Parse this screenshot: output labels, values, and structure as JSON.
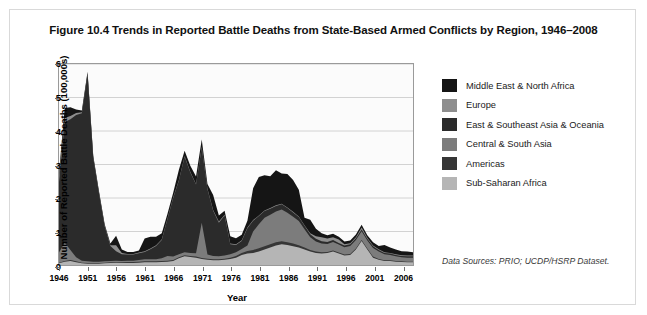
{
  "figure": {
    "title": "Figure 10.4 Trends in Reported Battle Deaths from State-Based Armed Conflicts by Region, 1946–2008",
    "data_sources": "Data Sources: PRIO; UCDP/HSRP Dataset."
  },
  "legend": {
    "items": [
      {
        "label": "Middle East & North Africa",
        "color": "#151515"
      },
      {
        "label": "Europe",
        "color": "#8e8e8e"
      },
      {
        "label": "East & Southeast Asia & Oceania",
        "color": "#2b2b2b"
      },
      {
        "label": "Central & South Asia",
        "color": "#7c7c7c"
      },
      {
        "label": "Americas",
        "color": "#363636"
      },
      {
        "label": "Sub-Saharan Africa",
        "color": "#b5b5b5"
      }
    ]
  },
  "chart_data": {
    "type": "area",
    "stacked": true,
    "title": "Figure 10.4 Trends in Reported Battle Deaths from State-Based Armed Conflicts by Region, 1946–2008",
    "xlabel": "Year",
    "ylabel": "Number of Reported Battle Deaths (100,000s)",
    "xlim": [
      1946,
      2008
    ],
    "ylim": [
      0,
      6
    ],
    "yticks": [
      0,
      1,
      2,
      3,
      4,
      5,
      6
    ],
    "xticks": [
      1946,
      1951,
      1956,
      1961,
      1966,
      1971,
      1976,
      1981,
      1986,
      1991,
      1996,
      2001,
      2006
    ],
    "grid": true,
    "legend_position": "right",
    "x": [
      1946,
      1947,
      1948,
      1949,
      1950,
      1951,
      1952,
      1953,
      1954,
      1955,
      1956,
      1957,
      1958,
      1959,
      1960,
      1961,
      1962,
      1963,
      1964,
      1965,
      1966,
      1967,
      1968,
      1969,
      1970,
      1971,
      1972,
      1973,
      1974,
      1975,
      1976,
      1977,
      1978,
      1979,
      1980,
      1981,
      1982,
      1983,
      1984,
      1985,
      1986,
      1987,
      1988,
      1989,
      1990,
      1991,
      1992,
      1993,
      1994,
      1995,
      1996,
      1997,
      1998,
      1999,
      2000,
      2001,
      2002,
      2003,
      2004,
      2005,
      2006,
      2007,
      2008
    ],
    "series": [
      {
        "name": "Sub-Saharan Africa",
        "color": "#b5b5b5",
        "values": [
          0.05,
          0.1,
          0.12,
          0.08,
          0.05,
          0.04,
          0.04,
          0.04,
          0.05,
          0.06,
          0.07,
          0.06,
          0.06,
          0.06,
          0.07,
          0.08,
          0.08,
          0.08,
          0.09,
          0.1,
          0.12,
          0.2,
          0.26,
          0.24,
          0.22,
          0.18,
          0.16,
          0.14,
          0.14,
          0.16,
          0.18,
          0.22,
          0.3,
          0.34,
          0.36,
          0.4,
          0.46,
          0.52,
          0.58,
          0.62,
          0.6,
          0.56,
          0.52,
          0.46,
          0.4,
          0.36,
          0.34,
          0.36,
          0.4,
          0.34,
          0.28,
          0.3,
          0.46,
          0.72,
          0.46,
          0.22,
          0.16,
          0.12,
          0.12,
          0.1,
          0.09,
          0.08,
          0.08
        ]
      },
      {
        "name": "Americas",
        "color": "#363636",
        "values": [
          0.02,
          0.02,
          0.03,
          0.03,
          0.02,
          0.02,
          0.02,
          0.02,
          0.02,
          0.02,
          0.02,
          0.02,
          0.03,
          0.03,
          0.03,
          0.03,
          0.03,
          0.03,
          0.03,
          0.03,
          0.03,
          0.03,
          0.03,
          0.03,
          0.03,
          0.03,
          0.03,
          0.03,
          0.03,
          0.03,
          0.04,
          0.05,
          0.06,
          0.08,
          0.09,
          0.1,
          0.1,
          0.1,
          0.1,
          0.09,
          0.08,
          0.08,
          0.07,
          0.06,
          0.05,
          0.04,
          0.04,
          0.03,
          0.03,
          0.03,
          0.03,
          0.03,
          0.03,
          0.03,
          0.03,
          0.03,
          0.02,
          0.02,
          0.02,
          0.02,
          0.02,
          0.02,
          0.02
        ]
      },
      {
        "name": "Central & South Asia",
        "color": "#7c7c7c",
        "values": [
          0.3,
          0.55,
          0.3,
          0.12,
          0.06,
          0.05,
          0.04,
          0.04,
          0.04,
          0.04,
          0.04,
          0.04,
          0.04,
          0.04,
          0.05,
          0.06,
          0.06,
          0.06,
          0.08,
          0.14,
          0.1,
          0.09,
          0.09,
          0.09,
          0.1,
          1.05,
          0.12,
          0.1,
          0.09,
          0.09,
          0.1,
          0.11,
          0.12,
          0.16,
          0.55,
          0.72,
          0.85,
          0.88,
          0.92,
          0.95,
          0.88,
          0.8,
          0.72,
          0.55,
          0.38,
          0.3,
          0.26,
          0.24,
          0.26,
          0.24,
          0.22,
          0.24,
          0.26,
          0.26,
          0.24,
          0.26,
          0.22,
          0.18,
          0.16,
          0.14,
          0.12,
          0.12,
          0.12
        ]
      },
      {
        "name": "East & Southeast Asia & Oceania",
        "color": "#2b2b2b",
        "values": [
          2.1,
          3.6,
          3.9,
          4.25,
          4.4,
          5.6,
          3.1,
          2.05,
          1.05,
          0.45,
          0.28,
          0.2,
          0.18,
          0.18,
          0.2,
          0.22,
          0.3,
          0.4,
          0.55,
          1.1,
          1.75,
          2.2,
          2.85,
          2.4,
          2.05,
          2.25,
          1.95,
          1.35,
          1.0,
          1.2,
          0.3,
          0.22,
          0.24,
          0.52,
          0.32,
          0.24,
          0.2,
          0.18,
          0.16,
          0.15,
          0.14,
          0.13,
          0.12,
          0.1,
          0.09,
          0.08,
          0.07,
          0.06,
          0.06,
          0.05,
          0.05,
          0.05,
          0.05,
          0.05,
          0.05,
          0.05,
          0.05,
          0.04,
          0.04,
          0.04,
          0.04,
          0.04,
          0.04
        ]
      },
      {
        "name": "Europe",
        "color": "#8e8e8e",
        "values": [
          0.18,
          0.12,
          0.1,
          0.06,
          0.03,
          0.02,
          0.02,
          0.02,
          0.02,
          0.02,
          0.18,
          0.04,
          0.02,
          0.02,
          0.02,
          0.02,
          0.02,
          0.02,
          0.02,
          0.02,
          0.02,
          0.02,
          0.02,
          0.02,
          0.02,
          0.02,
          0.02,
          0.02,
          0.04,
          0.02,
          0.02,
          0.02,
          0.02,
          0.02,
          0.02,
          0.02,
          0.02,
          0.02,
          0.02,
          0.02,
          0.02,
          0.02,
          0.02,
          0.02,
          0.03,
          0.08,
          0.12,
          0.1,
          0.08,
          0.1,
          0.04,
          0.03,
          0.03,
          0.06,
          0.03,
          0.02,
          0.02,
          0.02,
          0.02,
          0.02,
          0.02,
          0.02,
          0.02
        ]
      },
      {
        "name": "Middle East & North Africa",
        "color": "#151515",
        "values": [
          0.1,
          0.3,
          0.26,
          0.1,
          0.05,
          0.04,
          0.04,
          0.04,
          0.04,
          0.05,
          0.28,
          0.1,
          0.06,
          0.06,
          0.06,
          0.38,
          0.35,
          0.25,
          0.18,
          0.14,
          0.14,
          0.3,
          0.16,
          0.18,
          0.22,
          0.22,
          0.14,
          0.45,
          0.18,
          0.12,
          0.22,
          0.18,
          0.16,
          0.2,
          0.95,
          1.15,
          1.05,
          0.95,
          1.05,
          0.9,
          1.0,
          0.95,
          0.8,
          0.22,
          0.4,
          0.22,
          0.12,
          0.1,
          0.1,
          0.08,
          0.08,
          0.08,
          0.08,
          0.08,
          0.08,
          0.1,
          0.1,
          0.22,
          0.16,
          0.14,
          0.12,
          0.12,
          0.1
        ]
      }
    ]
  }
}
